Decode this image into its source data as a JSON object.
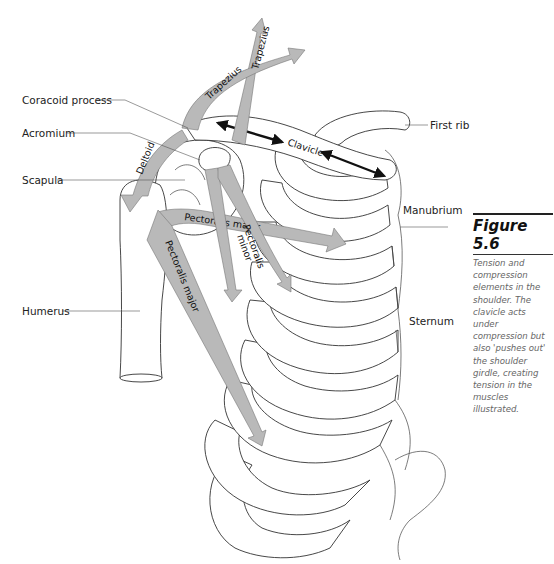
{
  "figure": {
    "number": "Figure 5.6",
    "caption_lines": [
      "Tension and",
      "compression",
      "elements in the",
      "shoulder. The",
      "clavicle acts",
      "under",
      "compression but",
      "also 'pushes out'",
      "the shoulder",
      "girdle, creating",
      "tension in the",
      "muscles",
      "illustrated."
    ]
  },
  "labels": {
    "coracoid": "Coracoid process",
    "acromium": "Acromium",
    "scapula": "Scapula",
    "humerus": "Humerus",
    "first_rib": "First rib",
    "manubrium": "Manubrium",
    "sternum": "Sternum"
  },
  "muscles": {
    "trapezius_upper": "Trapezius",
    "trapezius_lower": "Trapezius",
    "deltoid": "Deltoid",
    "clavicle": "Clavicle",
    "pectoralis_major_horizontal": "Pectoralis major",
    "pectoralis_major_diagonal": "Pectoralis major",
    "pectoralis_minor_line1": "Pectoralis",
    "pectoralis_minor_line2": "minor"
  },
  "colors": {
    "muscle_fill": "#b9b9b9",
    "compression_arrow": "#111111",
    "caption_text": "#666666"
  }
}
